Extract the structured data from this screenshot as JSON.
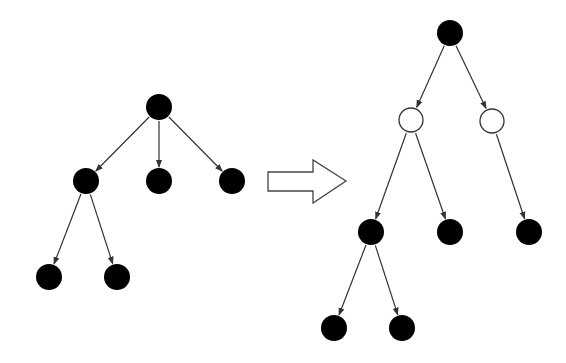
{
  "diagram": {
    "colors": {
      "background": "#ffffff",
      "filled_node": "#000000",
      "hollow_node_fill": "#ffffff",
      "stroke": "#333333",
      "arrow_outline": "#444444"
    },
    "node_radius": 13,
    "left_tree": {
      "nodes": [
        {
          "id": "L0",
          "x": 159,
          "y": 107,
          "type": "filled"
        },
        {
          "id": "L1",
          "x": 86,
          "y": 181,
          "type": "filled"
        },
        {
          "id": "L2",
          "x": 159,
          "y": 181,
          "type": "filled"
        },
        {
          "id": "L3",
          "x": 232,
          "y": 181,
          "type": "filled"
        },
        {
          "id": "L4",
          "x": 49,
          "y": 277,
          "type": "filled"
        },
        {
          "id": "L5",
          "x": 117,
          "y": 277,
          "type": "filled"
        }
      ],
      "edges": [
        [
          "L0",
          "L1"
        ],
        [
          "L0",
          "L2"
        ],
        [
          "L0",
          "L3"
        ],
        [
          "L1",
          "L4"
        ],
        [
          "L1",
          "L5"
        ]
      ]
    },
    "transform_arrow": {
      "points": "268,172 313,172 313,160 346,181 313,203 313,191 268,191"
    },
    "right_tree": {
      "nodes": [
        {
          "id": "R0",
          "x": 450,
          "y": 33,
          "type": "filled"
        },
        {
          "id": "R1",
          "x": 411,
          "y": 120,
          "type": "hollow"
        },
        {
          "id": "R2",
          "x": 492,
          "y": 121,
          "type": "hollow"
        },
        {
          "id": "R3",
          "x": 371,
          "y": 232,
          "type": "filled"
        },
        {
          "id": "R4",
          "x": 450,
          "y": 232,
          "type": "filled"
        },
        {
          "id": "R5",
          "x": 529,
          "y": 232,
          "type": "filled"
        },
        {
          "id": "R6",
          "x": 334,
          "y": 328,
          "type": "filled"
        },
        {
          "id": "R7",
          "x": 402,
          "y": 328,
          "type": "filled"
        }
      ],
      "edges": [
        [
          "R0",
          "R1"
        ],
        [
          "R0",
          "R2"
        ],
        [
          "R1",
          "R3"
        ],
        [
          "R1",
          "R4"
        ],
        [
          "R2",
          "R5"
        ],
        [
          "R3",
          "R6"
        ],
        [
          "R3",
          "R7"
        ]
      ]
    }
  }
}
